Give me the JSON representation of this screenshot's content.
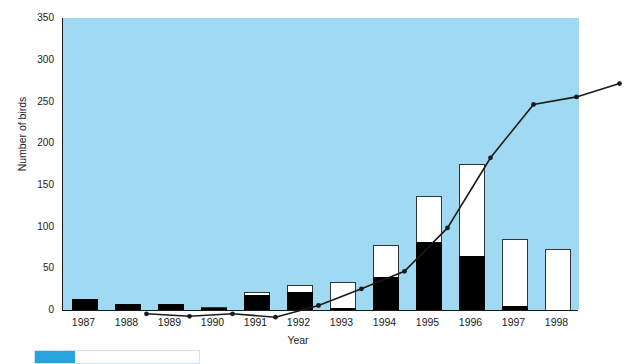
{
  "chart_data": {
    "type": "bar",
    "title": "",
    "xlabel": "Year",
    "ylabel": "Number of birds",
    "categories": [
      "1987",
      "1988",
      "1989",
      "1990",
      "1991",
      "1992",
      "1993",
      "1994",
      "1995",
      "1996",
      "1997",
      "1998"
    ],
    "ylim": [
      0,
      350
    ],
    "yticks": [
      0,
      50,
      100,
      150,
      200,
      250,
      300,
      350
    ],
    "grid": false,
    "legend_position": "none",
    "series": [
      {
        "name": "Black segment",
        "type": "bar",
        "stack": "bars",
        "values": [
          13,
          7,
          7,
          3,
          18,
          22,
          2,
          40,
          82,
          65,
          5,
          0
        ]
      },
      {
        "name": "White segment",
        "type": "bar",
        "stack": "bars",
        "values": [
          0,
          0,
          0,
          1,
          3,
          8,
          32,
          38,
          55,
          110,
          80,
          73
        ]
      },
      {
        "name": "Totals",
        "type": "bar",
        "computed": true,
        "values": [
          13,
          7,
          7,
          4,
          21,
          30,
          34,
          78,
          137,
          175,
          85,
          73
        ]
      },
      {
        "name": "Line series",
        "type": "line",
        "values": [
          17,
          14,
          17,
          13,
          27,
          47,
          68,
          120,
          204,
          268,
          277,
          293
        ]
      }
    ]
  },
  "axes": {
    "y_title": "Number of birds",
    "x_title": "Year",
    "y_tick_labels": [
      "350",
      "300",
      "250",
      "200",
      "150",
      "100",
      "50",
      "0"
    ],
    "x_tick_labels": [
      "1987",
      "1988",
      "1989",
      "1990",
      "1991",
      "1992",
      "1993",
      "1994",
      "1995",
      "1996",
      "1997",
      "1998"
    ]
  },
  "style": {
    "plot_background": "#9fd9f2",
    "bar_black": "#000000",
    "bar_white": "#ffffff",
    "line_color": "#1a1a1a",
    "axis_color": "#1a1a1a",
    "caption_tag_color": "#29a3e0"
  },
  "caption": {
    "tag": "",
    "text": ""
  }
}
